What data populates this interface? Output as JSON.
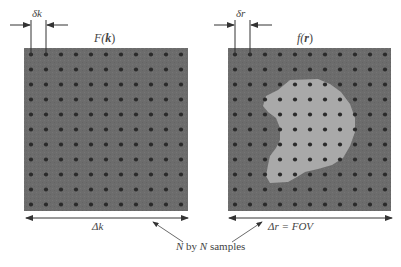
{
  "panels": [
    {
      "id": "k-space",
      "title": "F(k)",
      "title_var": "F",
      "title_arg": "k",
      "spacing_label": "δk",
      "width_label": "Δk",
      "grid_n": 11,
      "has_object": false
    },
    {
      "id": "image-space",
      "title": "f(r)",
      "title_var": "f",
      "title_arg": "r",
      "spacing_label": "δr",
      "width_label": "Δr = FOV",
      "grid_n": 11,
      "has_object": true
    }
  ],
  "annotation": {
    "text": "N by N samples"
  },
  "labels": {
    "left_title_f": "F(",
    "left_title_k": "k",
    "left_title_close": ")",
    "right_title_f": "f(",
    "right_title_r": "r",
    "right_title_close": ")",
    "delta_k_small": "δk",
    "delta_r_small": "δr",
    "delta_k_big": "Δk",
    "delta_r_big": "Δr = FOV",
    "n": "N",
    "by": " by ",
    "n2": "N",
    "samples": " samples"
  },
  "colors": {
    "panel_bg": "#6e6e6e",
    "dot": "#2a2a2a",
    "object": "#a8a8a8",
    "line": "#333333"
  }
}
